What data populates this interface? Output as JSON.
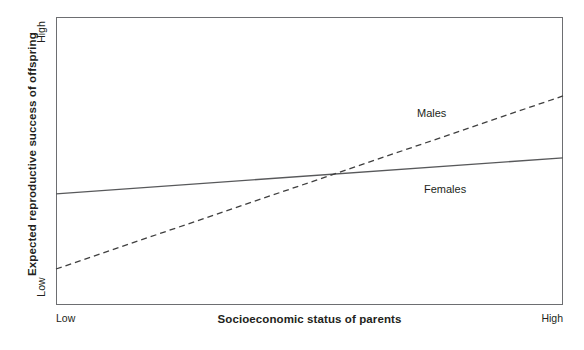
{
  "chart_data": {
    "type": "line",
    "title": "",
    "subtitle": "",
    "xlabel": "Socioeconomic status of parents",
    "ylabel": "Expected reproductive success of offspring",
    "x": [
      0,
      1
    ],
    "xtick_labels": [
      "Low",
      "High"
    ],
    "ytick_labels": [
      "Low",
      "High"
    ],
    "xlim": [
      0,
      1
    ],
    "ylim": [
      0,
      1
    ],
    "grid": false,
    "legend_position": "inline-annotation",
    "series": [
      {
        "name": "Males",
        "style": "dashed",
        "color": "#3f3f3f",
        "values": [
          0.125,
          0.726
        ],
        "label_text": "Males"
      },
      {
        "name": "Females",
        "style": "solid",
        "color": "#58595b",
        "values": [
          0.386,
          0.511
        ],
        "label_text": "Females"
      }
    ],
    "annotations": [
      {
        "text": "Males",
        "series": "Males"
      },
      {
        "text": "Females",
        "series": "Females"
      }
    ]
  },
  "axes": {
    "y_title": "Expected reproductive success of offspring",
    "x_title": "Socioeconomic status of parents",
    "y_high_label": "High",
    "y_low_label": "Low",
    "x_low_label": "Low",
    "x_high_label": "High"
  },
  "series_labels": {
    "males": "Males",
    "females": "Females"
  },
  "colors": {
    "frame": "#6d6e71",
    "males_line": "#3f3f3f",
    "females_line": "#58595b",
    "text": "#231f20",
    "background": "#ffffff"
  }
}
